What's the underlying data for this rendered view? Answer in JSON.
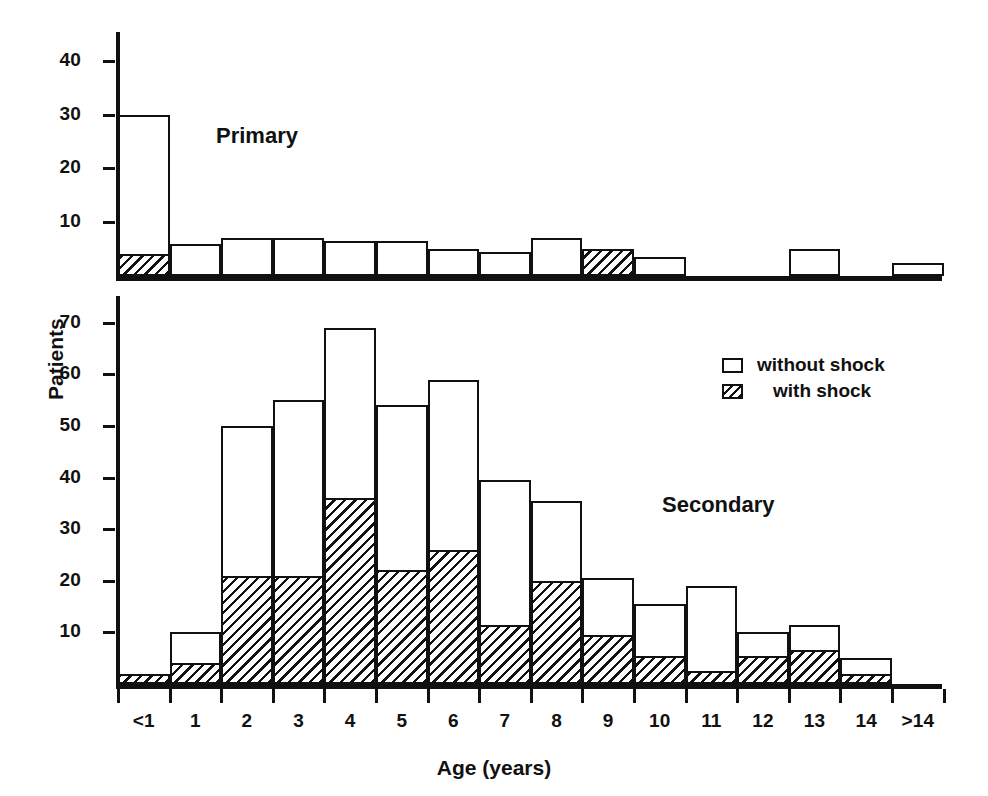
{
  "chart_data": {
    "type": "bar",
    "title": "",
    "xlabel": "Age (years)",
    "ylabel": "Patients",
    "grid": false,
    "legend_position": "upper-right-of-lower-panel",
    "legend": [
      {
        "key": "without_shock",
        "label": "without shock",
        "swatch": "open-rectangle"
      },
      {
        "key": "with_shock",
        "label": "with shock",
        "swatch": "hatched-rectangle"
      }
    ],
    "categories": [
      "<1",
      "1",
      "2",
      "3",
      "4",
      "5",
      "6",
      "7",
      "8",
      "9",
      "10",
      "11",
      "12",
      "13",
      "14",
      ">14"
    ],
    "panels": [
      {
        "name": "primary",
        "label": "Primary",
        "ylim": [
          0,
          45
        ],
        "yticks": [
          10,
          20,
          30,
          40
        ],
        "ytick_labels": [
          "10",
          "20",
          "30",
          "40"
        ],
        "series": [
          {
            "name": "with shock",
            "key": "with_shock",
            "values": [
              4,
              0,
              0,
              0,
              0,
              0,
              0,
              0,
              0,
              5,
              0,
              0,
              0,
              0,
              0,
              0
            ]
          },
          {
            "name": "without shock",
            "key": "without_shock",
            "values": [
              26,
              6,
              7,
              7,
              6.5,
              6.5,
              5,
              4.5,
              7,
              0,
              3.5,
              0,
              0,
              5,
              0,
              2.5
            ]
          }
        ],
        "totals": [
          30,
          6,
          7,
          7,
          6.5,
          6.5,
          5,
          4.5,
          7,
          5,
          3.5,
          0,
          0,
          5,
          0,
          2.5
        ]
      },
      {
        "name": "secondary",
        "label": "Secondary",
        "ylim": [
          0,
          75
        ],
        "yticks": [
          10,
          20,
          30,
          40,
          50,
          60,
          70
        ],
        "ytick_labels": [
          "10",
          "20",
          "30",
          "40",
          "50",
          "60",
          "70"
        ],
        "series": [
          {
            "name": "with shock",
            "key": "with_shock",
            "values": [
              2,
              4,
              21,
              21,
              36,
              22,
              26,
              11.5,
              20,
              9.5,
              5.5,
              2.5,
              5.5,
              6.5,
              2,
              0
            ]
          },
          {
            "name": "without shock",
            "key": "without_shock",
            "values": [
              0,
              6,
              29,
              34,
              33,
              32,
              33,
              28,
              15.5,
              11,
              10,
              16.5,
              4.5,
              5,
              3,
              0
            ]
          }
        ],
        "totals": [
          2,
          10,
          50,
          55,
          69,
          54,
          59,
          39.5,
          35.5,
          20.5,
          15.5,
          19,
          10,
          11.5,
          5,
          0
        ]
      }
    ]
  },
  "figure": {
    "y_axis_title": "Patients",
    "x_axis_title": "Age (years)",
    "primary_panel_label": "Primary",
    "secondary_panel_label": "Secondary",
    "legend_without_shock": "without shock",
    "legend_with_shock": "with shock",
    "ink_color": "#111111",
    "background_color": "#ffffff"
  }
}
